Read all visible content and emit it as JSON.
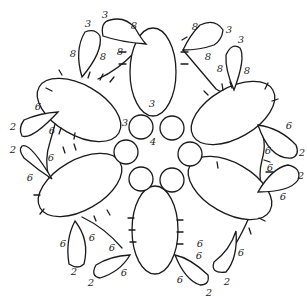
{
  "diagram": {
    "stroke_color": "#1a1a1a",
    "background": "#ffffff",
    "center_ring": {
      "rings": 6,
      "labels": [
        {
          "text": "3",
          "x": 152,
          "y": 104
        },
        {
          "text": "3",
          "x": 125,
          "y": 123
        },
        {
          "text": "4",
          "x": 153,
          "y": 142
        }
      ]
    },
    "chains_labels": [
      {
        "text": "3",
        "x": 105,
        "y": 15
      },
      {
        "text": "8",
        "x": 134,
        "y": 26
      },
      {
        "text": "3",
        "x": 88,
        "y": 24
      },
      {
        "text": "8",
        "x": 73,
        "y": 54
      },
      {
        "text": "8",
        "x": 103,
        "y": 57
      },
      {
        "text": "8",
        "x": 120,
        "y": 52
      },
      {
        "text": "8",
        "x": 195,
        "y": 27
      },
      {
        "text": "3",
        "x": 229,
        "y": 30
      },
      {
        "text": "8",
        "x": 208,
        "y": 57
      },
      {
        "text": "3",
        "x": 241,
        "y": 40
      },
      {
        "text": "8",
        "x": 220,
        "y": 69
      },
      {
        "text": "8",
        "x": 247,
        "y": 71
      },
      {
        "text": "6",
        "x": 289,
        "y": 126
      },
      {
        "text": "2",
        "x": 302,
        "y": 153
      },
      {
        "text": "6",
        "x": 268,
        "y": 151
      },
      {
        "text": "6",
        "x": 270,
        "y": 168
      },
      {
        "text": "2",
        "x": 301,
        "y": 176
      },
      {
        "text": "6",
        "x": 283,
        "y": 197
      },
      {
        "text": "6",
        "x": 38,
        "y": 107
      },
      {
        "text": "2",
        "x": 13,
        "y": 127
      },
      {
        "text": "6",
        "x": 52,
        "y": 131
      },
      {
        "text": "2",
        "x": 13,
        "y": 150
      },
      {
        "text": "6",
        "x": 51,
        "y": 158
      },
      {
        "text": "6",
        "x": 30,
        "y": 178
      },
      {
        "text": "6",
        "x": 63,
        "y": 244
      },
      {
        "text": "6",
        "x": 92,
        "y": 238
      },
      {
        "text": "6",
        "x": 112,
        "y": 248
      },
      {
        "text": "2",
        "x": 74,
        "y": 272
      },
      {
        "text": "6",
        "x": 124,
        "y": 273
      },
      {
        "text": "2",
        "x": 91,
        "y": 283
      },
      {
        "text": "6",
        "x": 200,
        "y": 244
      },
      {
        "text": "6",
        "x": 241,
        "y": 253
      },
      {
        "text": "6",
        "x": 199,
        "y": 256
      },
      {
        "text": "2",
        "x": 227,
        "y": 282
      },
      {
        "text": "6",
        "x": 180,
        "y": 280
      },
      {
        "text": "2",
        "x": 209,
        "y": 293
      }
    ]
  }
}
